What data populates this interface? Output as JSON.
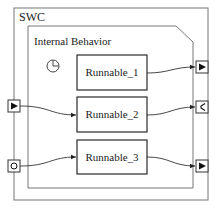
{
  "swc": {
    "label": "SWC",
    "internal_behavior": {
      "label": "Internal Behavior",
      "timer_icon": "clock-icon",
      "runnables": [
        {
          "label": "Runnable_1"
        },
        {
          "label": "Runnable_2"
        },
        {
          "label": "Runnable_3"
        }
      ]
    },
    "ports": {
      "left": [
        {
          "type": "receiver-port",
          "icon": "triangle-right-icon",
          "connects_to": "Runnable_2"
        },
        {
          "type": "client-server-port",
          "icon": "circle-icon",
          "connects_to": "Runnable_3"
        }
      ],
      "right": [
        {
          "type": "sender-port",
          "icon": "triangle-right-icon",
          "connects_from": "Runnable_1"
        },
        {
          "type": "server-port",
          "icon": "c-shape-icon",
          "connects_from": "Runnable_2"
        },
        {
          "type": "sender-port",
          "icon": "triangle-right-icon",
          "connects_from": "Runnable_3"
        }
      ]
    }
  },
  "colors": {
    "outer_border": "#6b6b6b",
    "inner_border": "#6b6b6b",
    "runnable_border": "#2a2a2a",
    "connector": "#333333"
  }
}
